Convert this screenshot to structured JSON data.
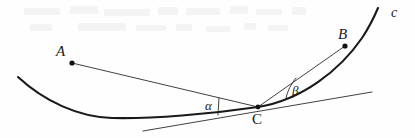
{
  "figure": {
    "caption_present": false,
    "background_color": "#fefefe",
    "ink_color": "#1a1a1a",
    "thin_ink_color": "#333333",
    "width": 415,
    "height": 138
  },
  "labels": {
    "point_a": "A",
    "point_b": "B",
    "point_c": "C",
    "curve_c": "c",
    "angle_alpha": "α",
    "angle_beta": "β"
  },
  "chart_data": {
    "type": "diagram",
    "title": "",
    "points": [
      {
        "name": "A",
        "x": 72,
        "y": 63,
        "marker": "dot"
      },
      {
        "name": "B",
        "x": 345,
        "y": 46,
        "marker": "dot"
      },
      {
        "name": "C",
        "x": 258,
        "y": 107,
        "marker": "dot"
      }
    ],
    "curves": [
      {
        "name": "c",
        "kind": "convex-curve",
        "stroke_width": 2.1,
        "path": "M 18 77 C 44 101, 78 117, 112 118 C 152 119, 210 114, 258 107 C 302 100, 340 70, 362 38 C 370 26, 375 15, 378 8"
      }
    ],
    "lines": [
      {
        "name": "tangent-at-C",
        "from": {
          "x": 143,
          "y": 131
        },
        "to": {
          "x": 372,
          "y": 92
        },
        "stroke_width": 0.9
      },
      {
        "name": "segment-CA",
        "from": {
          "x": 258,
          "y": 107
        },
        "to": {
          "x": 72,
          "y": 63
        },
        "stroke_width": 0.9
      },
      {
        "name": "segment-CB",
        "from": {
          "x": 258,
          "y": 107
        },
        "to": {
          "x": 345,
          "y": 46
        },
        "stroke_width": 0.9
      }
    ],
    "angle_marks": [
      {
        "name": "alpha",
        "label": "α",
        "vertex": {
          "x": 258,
          "y": 107
        },
        "style": "straight-tick",
        "path": "M 219 98 L 218 115"
      },
      {
        "name": "beta",
        "label": "β",
        "style": "arc",
        "vertex": {
          "x": 258,
          "y": 107
        },
        "path": "M 296 78 A 46 46 0 0 0 286 98"
      }
    ],
    "axis": {
      "shown": false
    },
    "grid": false,
    "legend": {
      "shown": false
    }
  },
  "artifacts": {
    "description": "faint scanner bleed-through marks across the top margin",
    "marks": [
      {
        "x": 24,
        "y": 8,
        "w": 36,
        "h": 7
      },
      {
        "x": 70,
        "y": 6,
        "w": 28,
        "h": 8
      },
      {
        "x": 104,
        "y": 9,
        "w": 46,
        "h": 7
      },
      {
        "x": 158,
        "y": 7,
        "w": 20,
        "h": 8
      },
      {
        "x": 186,
        "y": 8,
        "w": 34,
        "h": 7
      },
      {
        "x": 230,
        "y": 6,
        "w": 18,
        "h": 8
      },
      {
        "x": 256,
        "y": 9,
        "w": 26,
        "h": 6
      },
      {
        "x": 292,
        "y": 7,
        "w": 14,
        "h": 8
      },
      {
        "x": 30,
        "y": 24,
        "w": 22,
        "h": 7
      },
      {
        "x": 78,
        "y": 23,
        "w": 48,
        "h": 8
      },
      {
        "x": 136,
        "y": 25,
        "w": 30,
        "h": 6
      },
      {
        "x": 176,
        "y": 24,
        "w": 16,
        "h": 7
      },
      {
        "x": 206,
        "y": 26,
        "w": 24,
        "h": 6
      },
      {
        "x": 244,
        "y": 23,
        "w": 12,
        "h": 7
      },
      {
        "x": 268,
        "y": 25,
        "w": 20,
        "h": 6
      }
    ]
  }
}
